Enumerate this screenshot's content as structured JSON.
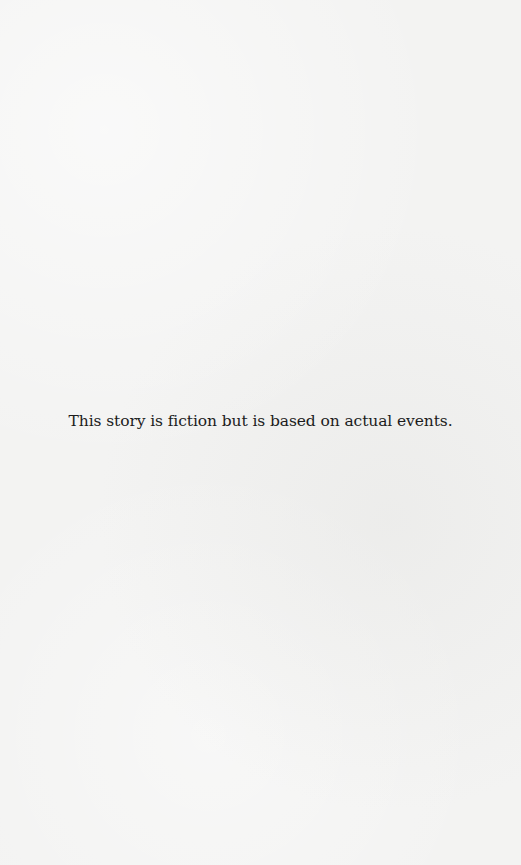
{
  "page": {
    "disclaimer": "This story is fiction but is based on actual events."
  }
}
